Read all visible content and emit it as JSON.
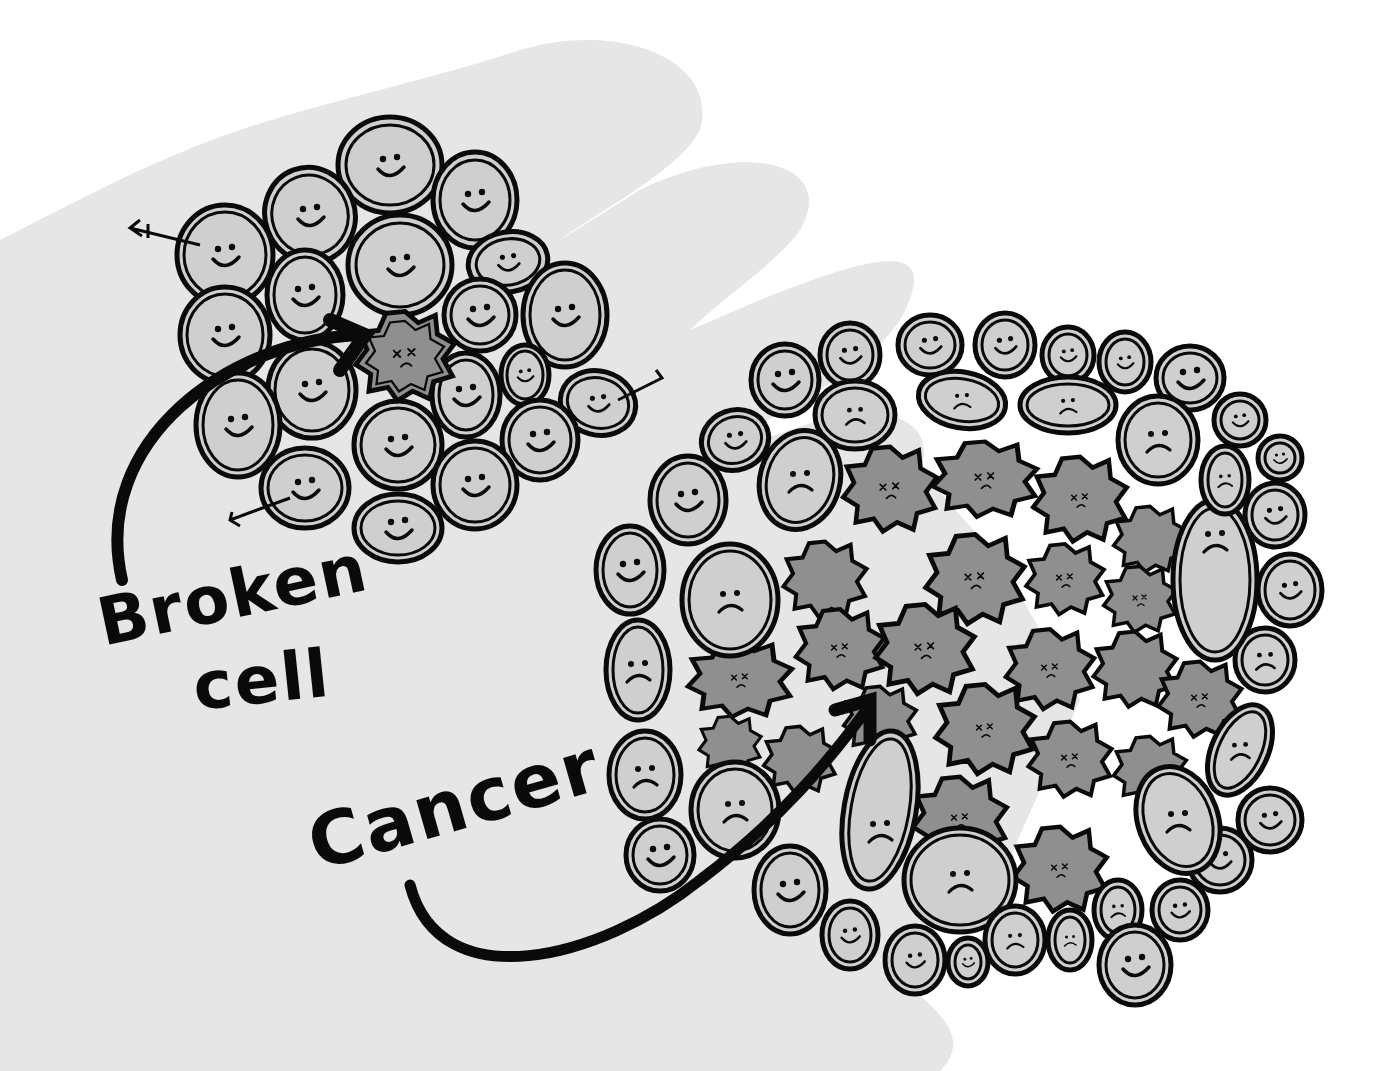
{
  "illustration": {
    "subject": "cells on a hand: healthy cell cluster with one broken cell, and a tumor (cancer) cluster",
    "labels": {
      "broken_line1": "Broken",
      "broken_line2": "cell",
      "cancer": "Cancer"
    },
    "colors": {
      "background": "#ffffff",
      "hand": "#e6e6e6",
      "healthy_cell_fill": "#cfcfcf",
      "broken_cell_fill": "#8f8f8f",
      "outline": "#0a0a0a"
    },
    "groups": {
      "healthy_cluster": {
        "cell_count": 20,
        "faces": "smiling",
        "broken_cells": 1
      },
      "cancer_cluster": {
        "outer_cells_faces": "smiling and frowning",
        "inner_cells": "spiky broken cells with x-eyes"
      }
    }
  }
}
